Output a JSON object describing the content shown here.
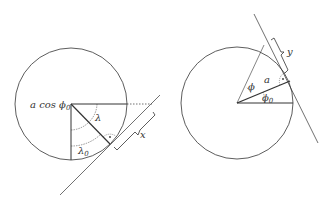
{
  "left_diagram": {
    "label_radius": "a cos ",
    "label_radius_sym": "ϕ",
    "label_radius_sub": "0",
    "angle_lambda": "λ",
    "angle_lambda0": "λ",
    "angle_lambda0_sub": "0",
    "distance": "x"
  },
  "right_diagram": {
    "angle_phi": "ϕ",
    "radius": "a",
    "angle_phi0": "ϕ",
    "angle_phi0_sub": "0",
    "distance": "y"
  }
}
